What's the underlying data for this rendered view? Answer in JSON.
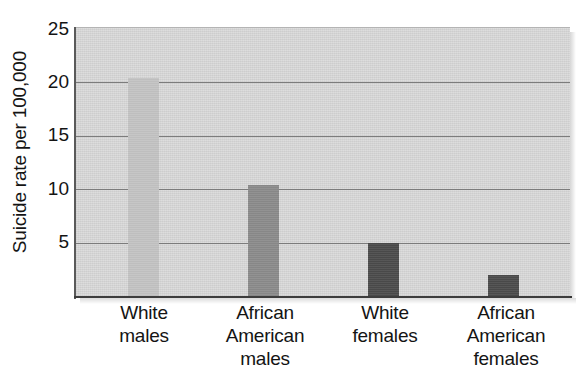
{
  "chart_data": {
    "type": "bar",
    "title": "",
    "xlabel": "",
    "ylabel": "Suicide rate per 100,000",
    "categories": [
      "White males",
      "African American males",
      "White females",
      "African American females"
    ],
    "category_lines": [
      [
        "White",
        "males"
      ],
      [
        "African",
        "American",
        "males"
      ],
      [
        "White",
        "females"
      ],
      [
        "African",
        "American",
        "females"
      ]
    ],
    "values": [
      20.4,
      10.4,
      5.0,
      2.0
    ],
    "bar_colors": [
      "#c2c2c2",
      "#8a8a8a",
      "#4a4a4a",
      "#4a4a4a"
    ],
    "ylim": [
      0,
      25
    ],
    "yticks": [
      5,
      10,
      15,
      20,
      25
    ],
    "ytick_labels": [
      "5",
      "10",
      "15",
      "20",
      "25"
    ],
    "grid": true,
    "grid_axis": "y",
    "legend": "none",
    "plot_background": "#d2d2d2",
    "gridline_color": "#7c7c7c",
    "axis_color": "#3d3d3d"
  }
}
